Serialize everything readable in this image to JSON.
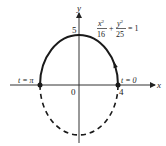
{
  "diagram": {
    "type": "parametric-ellipse",
    "equation": {
      "term1_num": "x",
      "term1_exp": "2",
      "term1_den": "16",
      "plus": "+",
      "term2_num": "y",
      "term2_exp": "2",
      "term2_den": "25",
      "equals": "= 1"
    },
    "axes": {
      "x_label": "x",
      "y_label": "y",
      "origin_label": "0"
    },
    "ticks": {
      "x_intercept": "4",
      "y_intercept": "5"
    },
    "semi_axes": {
      "a": 4,
      "b": 5
    },
    "points": [
      {
        "label": "t = 0",
        "x": 4,
        "y": 0
      },
      {
        "label": "t = π",
        "x": -4,
        "y": 0
      }
    ],
    "upper_half_style": "solid",
    "lower_half_style": "dashed",
    "direction": "counterclockwise",
    "colors": {
      "ink": "#1a1a1a",
      "axis": "#333333"
    }
  }
}
